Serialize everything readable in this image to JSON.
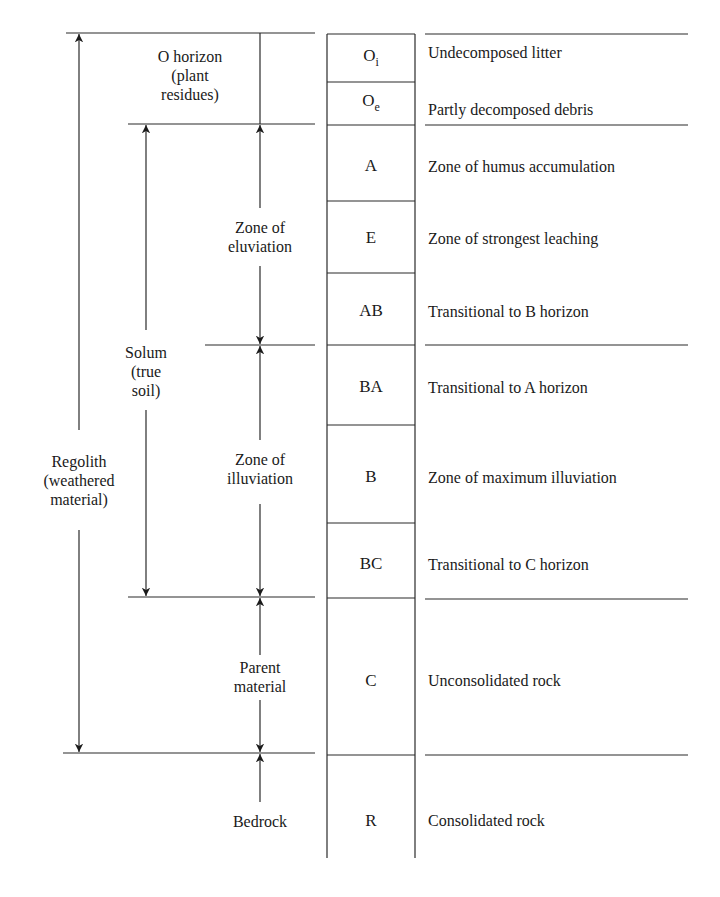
{
  "diagram": {
    "type": "soil-profile",
    "horizons": [
      {
        "code": "O",
        "sub": "i",
        "description": "Undecomposed litter",
        "top": 34,
        "bottom": 82,
        "desc_y": 53
      },
      {
        "code": "O",
        "sub": "e",
        "description": "Partly decomposed debris",
        "top": 82,
        "bottom": 125,
        "desc_y": 109
      },
      {
        "code": "A",
        "sub": "",
        "description": "Zone of humus accumulation",
        "top": 125,
        "bottom": 201,
        "desc_y": 167
      },
      {
        "code": "E",
        "sub": "",
        "description": "Zone of strongest leaching",
        "top": 201,
        "bottom": 273,
        "desc_y": 238
      },
      {
        "code": "AB",
        "sub": "",
        "description": "Transitional to B horizon",
        "top": 273,
        "bottom": 345,
        "desc_y": 312
      },
      {
        "code": "BA",
        "sub": "",
        "description": "Transitional to A horizon",
        "top": 345,
        "bottom": 425,
        "desc_y": 387
      },
      {
        "code": "B",
        "sub": "",
        "description": "Zone of maximum illuviation",
        "top": 425,
        "bottom": 523,
        "desc_y": 478
      },
      {
        "code": "BC",
        "sub": "",
        "description": "Transitional to C horizon",
        "top": 523,
        "bottom": 598,
        "desc_y": 565
      },
      {
        "code": "C",
        "sub": "",
        "description": "Unconsolidated rock",
        "top": 598,
        "bottom": 755,
        "desc_y": 681
      },
      {
        "code": "R",
        "sub": "",
        "description": "Consolidated rock",
        "top": 755,
        "bottom": 858,
        "desc_y": 821
      }
    ],
    "left_labels": {
      "o_horizon": [
        "O horizon",
        "(plant",
        "residues)"
      ],
      "eluviation": [
        "Zone of",
        "eluviation"
      ],
      "illuviation": [
        "Zone of",
        "illuviation"
      ],
      "solum": [
        "Solum",
        "(true",
        "soil)"
      ],
      "regolith": [
        "Regolith",
        "(weathered",
        "material)"
      ],
      "parent": [
        "Parent",
        "material"
      ],
      "bedrock": [
        "Bedrock"
      ]
    },
    "line_color": "#2a2a2a"
  }
}
